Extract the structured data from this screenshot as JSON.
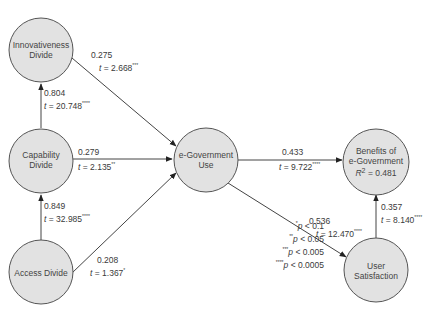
{
  "colors": {
    "node_fill": "#e2e2e2",
    "node_stroke": "#555555",
    "edge": "#444444",
    "text": "#3a3a3a"
  },
  "nodes": {
    "innovativeness": {
      "label_line1": "Innovativeness",
      "label_line2": "Divide"
    },
    "capability": {
      "label_line1": "Capability",
      "label_line2": "Divide"
    },
    "access": {
      "label_line1": "Access Divide"
    },
    "egov_use": {
      "label_line1": "e-Government",
      "label_line2": "Use"
    },
    "benefits": {
      "label_line1": "Benefits of",
      "label_line2": "e-Government",
      "r2_label": "R",
      "r2_sup": "2",
      "r2_value": " = 0.481"
    },
    "satisfaction": {
      "label_line1": "User",
      "label_line2": "Satisfaction"
    }
  },
  "edges": {
    "innov_to_use": {
      "coef": "0.275",
      "t_label": "t",
      "t_value": " = 2.668",
      "stars": "***"
    },
    "cap_to_innov": {
      "coef": "0.804",
      "t_label": "t",
      "t_value": " = 20.748",
      "stars": "****"
    },
    "cap_to_use": {
      "coef": "0.279",
      "t_label": "t",
      "t_value": " = 2.135",
      "stars": "**"
    },
    "access_to_cap": {
      "coef": "0.849",
      "t_label": "t",
      "t_value": " = 32.985",
      "stars": "****"
    },
    "access_to_use": {
      "coef": "0.208",
      "t_label": "t",
      "t_value": " = 1.367",
      "stars": "*"
    },
    "use_to_benefits": {
      "coef": "0.433",
      "t_label": "t",
      "t_value": " = 9.722",
      "stars": "****"
    },
    "use_to_satisfaction": {
      "coef": "0.536",
      "t_label": "t",
      "t_value": " = 12.470",
      "stars": "****"
    },
    "satisfaction_to_benefits": {
      "coef": "0.357",
      "t_label": "t",
      "t_value": " = 8.140",
      "stars": "****"
    }
  },
  "legend": [
    {
      "stars": "*",
      "p": "p",
      "text": " < 0.1"
    },
    {
      "stars": "**",
      "p": "p",
      "text": " < 0.05"
    },
    {
      "stars": "***",
      "p": "p",
      "text": " < 0.005"
    },
    {
      "stars": "****",
      "p": "p",
      "text": " < 0.0005"
    }
  ]
}
